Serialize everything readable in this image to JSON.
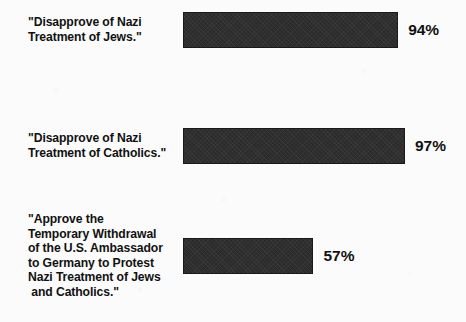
{
  "chart_data": {
    "type": "bar",
    "orientation": "horizontal",
    "title": "",
    "subtitle": "",
    "xlabel": "",
    "ylabel": "",
    "grid": false,
    "legend": false,
    "axis_visible": false,
    "xlim": [
      0,
      97
    ],
    "value_suffix": "%",
    "categories": [
      "\"Disapprove of Nazi\nTreatment of Jews.\"",
      "\"Disapprove of Nazi\nTreatment of Catholics.\"",
      "\"Approve the\nTemporary Withdrawal\nof the U.S. Ambassador\nto Germany to Protest\nNazi Treatment of Jews\n and Catholics.\""
    ],
    "values": [
      94,
      97,
      57
    ],
    "value_labels": [
      "94%",
      "97%",
      "57%"
    ],
    "colors": {
      "bar_fill": "#2b2b2b",
      "bar_border": "#1a1a1a",
      "text": "#111111",
      "background": "#fbfbfb"
    }
  },
  "bars": [
    {
      "label": "\"Disapprove of Nazi\nTreatment of Jews.\"",
      "value_label": "94%",
      "value": 94
    },
    {
      "label": "\"Disapprove of Nazi\nTreatment of Catholics.\"",
      "value_label": "97%",
      "value": 97
    },
    {
      "label": "\"Approve the\nTemporary Withdrawal\nof the U.S. Ambassador\nto Germany to Protest\nNazi Treatment of Jews\n and Catholics.\"",
      "value_label": "57%",
      "value": 57
    }
  ]
}
